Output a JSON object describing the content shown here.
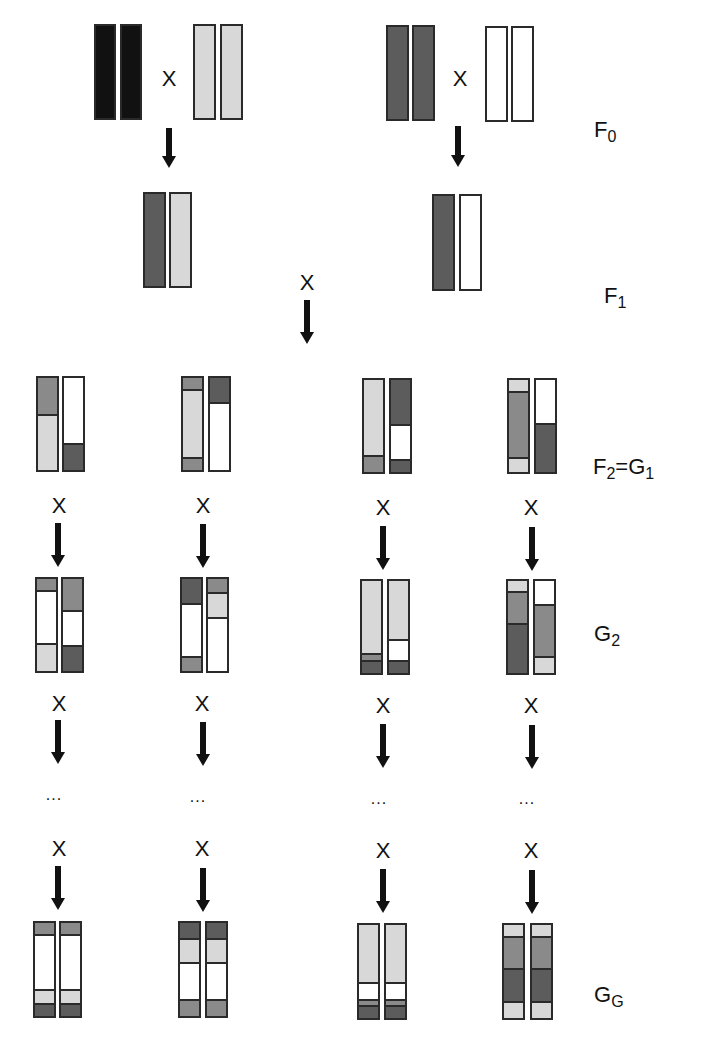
{
  "colors": {
    "K": "#111111",
    "D": "#5c5c5c",
    "M": "#8a8a8a",
    "L": "#d8d8d8",
    "W": "#ffffff"
  },
  "symbols": {
    "cross": "X",
    "ellipsis": "..."
  },
  "generation_labels": [
    {
      "id": "f0",
      "main": "F",
      "sub": "0",
      "x": 594,
      "y": 118
    },
    {
      "id": "f1",
      "main": "F",
      "sub": "1",
      "x": 604,
      "y": 284
    },
    {
      "id": "f2g1",
      "main": "F",
      "sub": "2",
      "tail_main": "=G",
      "tail_sub": "1",
      "x": 593,
      "y": 455
    },
    {
      "id": "g2",
      "main": "G",
      "sub": "2",
      "x": 594,
      "y": 622
    },
    {
      "id": "gg",
      "main": "G",
      "sub": "G",
      "x": 594,
      "y": 983
    }
  ],
  "chromosomes": [
    {
      "id": "f0-a1",
      "x": 94,
      "y": 24,
      "w": 22,
      "h": 96,
      "segs": [
        [
          1,
          "K"
        ]
      ]
    },
    {
      "id": "f0-a2",
      "x": 120,
      "y": 24,
      "w": 22,
      "h": 96,
      "segs": [
        [
          1,
          "K"
        ]
      ]
    },
    {
      "id": "f0-b1",
      "x": 193,
      "y": 24,
      "w": 23,
      "h": 96,
      "segs": [
        [
          1,
          "L"
        ]
      ]
    },
    {
      "id": "f0-b2",
      "x": 220,
      "y": 24,
      "w": 23,
      "h": 96,
      "segs": [
        [
          1,
          "L"
        ]
      ]
    },
    {
      "id": "f0-c1",
      "x": 386,
      "y": 25,
      "w": 23,
      "h": 96,
      "segs": [
        [
          1,
          "D"
        ]
      ]
    },
    {
      "id": "f0-c2",
      "x": 412,
      "y": 25,
      "w": 23,
      "h": 96,
      "segs": [
        [
          1,
          "D"
        ]
      ]
    },
    {
      "id": "f0-d1",
      "x": 485,
      "y": 26,
      "w": 23,
      "h": 96,
      "segs": [
        [
          1,
          "W"
        ]
      ]
    },
    {
      "id": "f0-d2",
      "x": 511,
      "y": 26,
      "w": 23,
      "h": 96,
      "segs": [
        [
          1,
          "W"
        ]
      ]
    },
    {
      "id": "f1-a1",
      "x": 143,
      "y": 192,
      "w": 23,
      "h": 96,
      "segs": [
        [
          1,
          "D"
        ]
      ]
    },
    {
      "id": "f1-a2",
      "x": 169,
      "y": 192,
      "w": 23,
      "h": 96,
      "segs": [
        [
          1,
          "L"
        ]
      ]
    },
    {
      "id": "f1-b1",
      "x": 432,
      "y": 194,
      "w": 23,
      "h": 97,
      "segs": [
        [
          1,
          "D"
        ]
      ]
    },
    {
      "id": "f1-b2",
      "x": 459,
      "y": 194,
      "w": 23,
      "h": 97,
      "segs": [
        [
          1,
          "W"
        ]
      ]
    },
    {
      "id": "g1-1a",
      "x": 36,
      "y": 376,
      "w": 23,
      "h": 96,
      "segs": [
        [
          0.4,
          "M"
        ],
        [
          0.6,
          "L"
        ]
      ]
    },
    {
      "id": "g1-1b",
      "x": 62,
      "y": 376,
      "w": 23,
      "h": 96,
      "segs": [
        [
          0.72,
          "W"
        ],
        [
          0.28,
          "D"
        ]
      ]
    },
    {
      "id": "g1-2a",
      "x": 181,
      "y": 376,
      "w": 23,
      "h": 96,
      "segs": [
        [
          0.13,
          "M"
        ],
        [
          0.74,
          "L"
        ],
        [
          0.13,
          "M"
        ]
      ]
    },
    {
      "id": "g1-2b",
      "x": 208,
      "y": 376,
      "w": 23,
      "h": 96,
      "segs": [
        [
          0.27,
          "D"
        ],
        [
          0.73,
          "W"
        ]
      ]
    },
    {
      "id": "g1-3a",
      "x": 362,
      "y": 378,
      "w": 23,
      "h": 96,
      "segs": [
        [
          0.83,
          "L"
        ],
        [
          0.17,
          "M"
        ]
      ]
    },
    {
      "id": "g1-3b",
      "x": 389,
      "y": 378,
      "w": 23,
      "h": 96,
      "segs": [
        [
          0.5,
          "D"
        ],
        [
          0.38,
          "W"
        ],
        [
          0.12,
          "D"
        ]
      ]
    },
    {
      "id": "g1-4a",
      "x": 507,
      "y": 378,
      "w": 23,
      "h": 96,
      "segs": [
        [
          0.12,
          "L"
        ],
        [
          0.73,
          "M"
        ],
        [
          0.15,
          "L"
        ]
      ]
    },
    {
      "id": "g1-4b",
      "x": 534,
      "y": 378,
      "w": 23,
      "h": 96,
      "segs": [
        [
          0.48,
          "W"
        ],
        [
          0.52,
          "D"
        ]
      ]
    },
    {
      "id": "g2-1a",
      "x": 35,
      "y": 577,
      "w": 23,
      "h": 96,
      "segs": [
        [
          0.12,
          "M"
        ],
        [
          0.58,
          "W"
        ],
        [
          0.3,
          "L"
        ]
      ]
    },
    {
      "id": "g2-1b",
      "x": 61,
      "y": 577,
      "w": 23,
      "h": 96,
      "segs": [
        [
          0.35,
          "M"
        ],
        [
          0.38,
          "W"
        ],
        [
          0.27,
          "D"
        ]
      ]
    },
    {
      "id": "g2-2a",
      "x": 180,
      "y": 577,
      "w": 23,
      "h": 96,
      "segs": [
        [
          0.27,
          "D"
        ],
        [
          0.58,
          "W"
        ],
        [
          0.15,
          "M"
        ]
      ]
    },
    {
      "id": "g2-2b",
      "x": 206,
      "y": 577,
      "w": 23,
      "h": 96,
      "segs": [
        [
          0.15,
          "M"
        ],
        [
          0.26,
          "L"
        ],
        [
          0.59,
          "W"
        ]
      ]
    },
    {
      "id": "g2-3a",
      "x": 360,
      "y": 579,
      "w": 23,
      "h": 96,
      "segs": [
        [
          0.82,
          "L"
        ],
        [
          0.05,
          "M"
        ],
        [
          0.13,
          "D"
        ]
      ]
    },
    {
      "id": "g2-3b",
      "x": 387,
      "y": 579,
      "w": 23,
      "h": 96,
      "segs": [
        [
          0.66,
          "L"
        ],
        [
          0.22,
          "W"
        ],
        [
          0.12,
          "D"
        ]
      ]
    },
    {
      "id": "g2-4a",
      "x": 506,
      "y": 579,
      "w": 23,
      "h": 96,
      "segs": [
        [
          0.11,
          "L"
        ],
        [
          0.35,
          "M"
        ],
        [
          0.54,
          "D"
        ]
      ]
    },
    {
      "id": "g2-4b",
      "x": 533,
      "y": 579,
      "w": 23,
      "h": 96,
      "segs": [
        [
          0.26,
          "W"
        ],
        [
          0.57,
          "M"
        ],
        [
          0.17,
          "L"
        ]
      ]
    },
    {
      "id": "gg-1a",
      "x": 33,
      "y": 921,
      "w": 23,
      "h": 97,
      "segs": [
        [
          0.13,
          "M"
        ],
        [
          0.6,
          "W"
        ],
        [
          0.14,
          "L"
        ],
        [
          0.13,
          "D"
        ]
      ]
    },
    {
      "id": "gg-1b",
      "x": 59,
      "y": 921,
      "w": 23,
      "h": 97,
      "segs": [
        [
          0.13,
          "M"
        ],
        [
          0.6,
          "W"
        ],
        [
          0.14,
          "L"
        ],
        [
          0.13,
          "D"
        ]
      ]
    },
    {
      "id": "gg-2a",
      "x": 178,
      "y": 921,
      "w": 23,
      "h": 97,
      "segs": [
        [
          0.17,
          "D"
        ],
        [
          0.25,
          "L"
        ],
        [
          0.41,
          "W"
        ],
        [
          0.17,
          "M"
        ]
      ]
    },
    {
      "id": "gg-2b",
      "x": 205,
      "y": 921,
      "w": 23,
      "h": 97,
      "segs": [
        [
          0.17,
          "D"
        ],
        [
          0.25,
          "L"
        ],
        [
          0.41,
          "W"
        ],
        [
          0.17,
          "M"
        ]
      ]
    },
    {
      "id": "gg-3a",
      "x": 357,
      "y": 923,
      "w": 23,
      "h": 97,
      "segs": [
        [
          0.66,
          "L"
        ],
        [
          0.17,
          "W"
        ],
        [
          0.04,
          "M"
        ],
        [
          0.13,
          "D"
        ]
      ]
    },
    {
      "id": "gg-3b",
      "x": 384,
      "y": 923,
      "w": 23,
      "h": 97,
      "segs": [
        [
          0.66,
          "L"
        ],
        [
          0.17,
          "W"
        ],
        [
          0.04,
          "M"
        ],
        [
          0.13,
          "D"
        ]
      ]
    },
    {
      "id": "gg-4a",
      "x": 502,
      "y": 923,
      "w": 23,
      "h": 97,
      "segs": [
        [
          0.13,
          "L"
        ],
        [
          0.34,
          "M"
        ],
        [
          0.36,
          "D"
        ],
        [
          0.17,
          "L"
        ]
      ]
    },
    {
      "id": "gg-4b",
      "x": 530,
      "y": 923,
      "w": 23,
      "h": 97,
      "segs": [
        [
          0.13,
          "L"
        ],
        [
          0.34,
          "M"
        ],
        [
          0.36,
          "D"
        ],
        [
          0.17,
          "L"
        ]
      ]
    }
  ],
  "crosses": [
    {
      "x": 157,
      "y": 68
    },
    {
      "x": 448,
      "y": 68
    },
    {
      "x": 295,
      "y": 272
    },
    {
      "x": 47,
      "y": 495
    },
    {
      "x": 191,
      "y": 495
    },
    {
      "x": 371,
      "y": 497
    },
    {
      "x": 519,
      "y": 497
    },
    {
      "x": 47,
      "y": 693
    },
    {
      "x": 190,
      "y": 693
    },
    {
      "x": 371,
      "y": 695
    },
    {
      "x": 519,
      "y": 695
    },
    {
      "x": 47,
      "y": 838
    },
    {
      "x": 190,
      "y": 838
    },
    {
      "x": 371,
      "y": 840
    },
    {
      "x": 519,
      "y": 840
    }
  ],
  "arrows": [
    {
      "x": 162,
      "y": 128,
      "len": 40
    },
    {
      "x": 451,
      "y": 126,
      "len": 41
    },
    {
      "x": 300,
      "y": 300,
      "len": 44
    },
    {
      "x": 51,
      "y": 523,
      "len": 44
    },
    {
      "x": 196,
      "y": 524,
      "len": 44
    },
    {
      "x": 376,
      "y": 526,
      "len": 44
    },
    {
      "x": 525,
      "y": 527,
      "len": 44
    },
    {
      "x": 51,
      "y": 720,
      "len": 44
    },
    {
      "x": 196,
      "y": 722,
      "len": 44
    },
    {
      "x": 376,
      "y": 724,
      "len": 44
    },
    {
      "x": 525,
      "y": 725,
      "len": 44
    },
    {
      "x": 51,
      "y": 866,
      "len": 44
    },
    {
      "x": 196,
      "y": 868,
      "len": 44
    },
    {
      "x": 376,
      "y": 869,
      "len": 44
    },
    {
      "x": 525,
      "y": 870,
      "len": 44
    }
  ],
  "ellipses": [
    {
      "x": 39,
      "y": 786
    },
    {
      "x": 183,
      "y": 788
    },
    {
      "x": 364,
      "y": 790
    },
    {
      "x": 512,
      "y": 790
    }
  ]
}
